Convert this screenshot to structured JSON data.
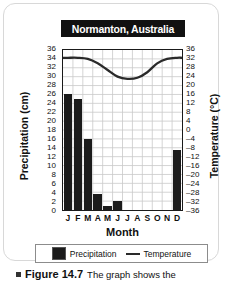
{
  "figure": {
    "title": "Normanton, Australia",
    "caption_label": "Figure 14.7",
    "caption_text": "The graph shows the",
    "bullet_icon": "square-bullet-icon"
  },
  "legend": {
    "precipitation_label": "Precipitation",
    "temperature_label": "Temperature",
    "precipitation_swatch_icon": "filled-square-icon",
    "temperature_swatch_icon": "line-segment-icon"
  },
  "colors": {
    "bar": "#1b1b1b",
    "line": "#2a2a2a",
    "grid": "#c9c9c9",
    "axis": "#1a1a1a",
    "title_bg": "#111111",
    "title_fg": "#ffffff",
    "panel_border": "#d8d8d8"
  },
  "chart_data": {
    "type": "bar",
    "title": "Normanton, Australia",
    "xlabel": "Month",
    "ylabel": "Precipitation (cm)",
    "y2label": "Temperature (°C)",
    "grid": true,
    "legend_position": "bottom",
    "categories": [
      "J",
      "F",
      "M",
      "A",
      "M",
      "J",
      "J",
      "A",
      "S",
      "O",
      "N",
      "D"
    ],
    "month_names": [
      "January",
      "February",
      "March",
      "April",
      "May",
      "June",
      "July",
      "August",
      "September",
      "October",
      "November",
      "December"
    ],
    "ylim": [
      0,
      36
    ],
    "ytick_step": 2,
    "yticks": [
      0,
      2,
      4,
      6,
      8,
      10,
      12,
      14,
      16,
      18,
      20,
      22,
      24,
      26,
      28,
      30,
      32,
      34,
      36
    ],
    "y2lim": [
      -36,
      36
    ],
    "y2tick_step": 4,
    "y2ticks": [
      36,
      32,
      28,
      24,
      20,
      16,
      12,
      8,
      4,
      0,
      -4,
      -8,
      -12,
      -16,
      -20,
      -24,
      -28,
      -32,
      -36
    ],
    "series": [
      {
        "name": "Precipitation",
        "type": "bar",
        "axis": "left",
        "unit": "cm",
        "values": [
          26,
          25,
          16,
          3.5,
          1,
          2,
          0,
          0,
          0,
          0,
          0,
          13.5
        ]
      },
      {
        "name": "Temperature",
        "type": "line",
        "axis": "right",
        "unit": "°C",
        "values": [
          32.5,
          32.5,
          32,
          30,
          27,
          24,
          23,
          23.5,
          26,
          30,
          32,
          32.5
        ]
      }
    ]
  }
}
